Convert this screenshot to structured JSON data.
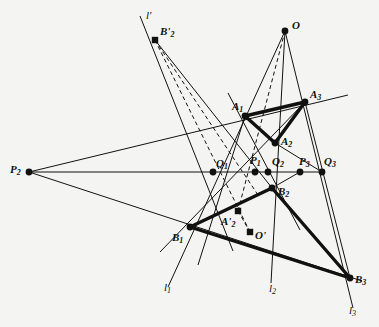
{
  "figure": {
    "background_color": "#f4f4f2",
    "ink_color": "#111111",
    "width": 379,
    "height": 327
  },
  "points": [
    {
      "id": "O",
      "label": "O",
      "sub": "",
      "prime": "",
      "x": 285,
      "y": 31,
      "lx": 292,
      "ly": 20,
      "marker": "dot"
    },
    {
      "id": "B2prime",
      "label": "B",
      "sub": "2",
      "prime": "'",
      "x": 155,
      "y": 40,
      "lx": 160,
      "ly": 26,
      "marker": "square"
    },
    {
      "id": "A3",
      "label": "A",
      "sub": "3",
      "prime": "",
      "x": 305,
      "y": 102,
      "lx": 310,
      "ly": 89,
      "marker": "dot"
    },
    {
      "id": "A1",
      "label": "A",
      "sub": "1",
      "prime": "",
      "x": 245,
      "y": 116,
      "lx": 232,
      "ly": 101,
      "marker": "dot"
    },
    {
      "id": "A2",
      "label": "A",
      "sub": "2",
      "prime": "",
      "x": 275,
      "y": 143,
      "lx": 281,
      "ly": 136,
      "marker": "dot"
    },
    {
      "id": "Q1",
      "label": "Q",
      "sub": "1",
      "prime": "",
      "x": 213,
      "y": 172,
      "lx": 216,
      "ly": 158,
      "marker": "dot"
    },
    {
      "id": "P1",
      "label": "P",
      "sub": "1",
      "prime": "",
      "x": 255,
      "y": 172,
      "lx": 250,
      "ly": 155,
      "marker": "dot"
    },
    {
      "id": "Q2",
      "label": "Q",
      "sub": "2",
      "prime": "",
      "x": 268,
      "y": 172,
      "lx": 272,
      "ly": 156,
      "marker": "dot"
    },
    {
      "id": "P3",
      "label": "P",
      "sub": "3",
      "prime": "",
      "x": 300,
      "y": 172,
      "lx": 299,
      "ly": 156,
      "marker": "dot"
    },
    {
      "id": "Q3",
      "label": "Q",
      "sub": "3",
      "prime": "",
      "x": 322,
      "y": 172,
      "lx": 324,
      "ly": 156,
      "marker": "dot"
    },
    {
      "id": "P2",
      "label": "P",
      "sub": "2",
      "prime": "",
      "x": 29,
      "y": 172,
      "lx": 10,
      "ly": 164,
      "marker": "dot"
    },
    {
      "id": "B2",
      "label": "B",
      "sub": "2",
      "prime": "",
      "x": 272,
      "y": 188,
      "lx": 278,
      "ly": 186,
      "marker": "dot"
    },
    {
      "id": "A2prime",
      "label": "A",
      "sub": "2",
      "prime": "'",
      "x": 238,
      "y": 211,
      "lx": 221,
      "ly": 216,
      "marker": "square"
    },
    {
      "id": "B1",
      "label": "B",
      "sub": "1",
      "prime": "",
      "x": 190,
      "y": 227,
      "lx": 172,
      "ly": 232,
      "marker": "dot"
    },
    {
      "id": "Oprime",
      "label": "O",
      "sub": "",
      "prime": "'",
      "x": 250,
      "y": 232,
      "lx": 255,
      "ly": 230,
      "marker": "square"
    },
    {
      "id": "B3",
      "label": "B",
      "sub": "3",
      "prime": "",
      "x": 350,
      "y": 278,
      "lx": 355,
      "ly": 274,
      "marker": "dot"
    }
  ],
  "line_labels": [
    {
      "id": "l-prime",
      "label": "l",
      "sub": "",
      "prime": "'",
      "lx": 146,
      "ly": 10
    },
    {
      "id": "l1",
      "label": "l",
      "sub": "1",
      "prime": "",
      "lx": 164,
      "ly": 282
    },
    {
      "id": "l2",
      "label": "l",
      "sub": "2",
      "prime": "",
      "lx": 269,
      "ly": 283
    },
    {
      "id": "l3",
      "label": "l",
      "sub": "3",
      "prime": "",
      "lx": 349,
      "ly": 305
    }
  ],
  "segments_thin": [
    {
      "name": "line-O-A1-B1-l1",
      "x1": 285,
      "y1": 31,
      "x2": 168,
      "y2": 287
    },
    {
      "name": "line-O-A2-B2-l2",
      "x1": 285,
      "y1": 31,
      "x2": 271,
      "y2": 283
    },
    {
      "name": "line-O-A3-B3-l3",
      "x1": 285,
      "y1": 31,
      "x2": 353,
      "y2": 308
    },
    {
      "name": "line-lprime-B2prime",
      "x1": 140,
      "y1": 16,
      "x2": 233,
      "y2": 251
    },
    {
      "name": "line-P2-A1-A3-ext",
      "x1": 29,
      "y1": 172,
      "x2": 348,
      "y2": 95
    },
    {
      "name": "line-P2-B1-B3-ext",
      "x1": 29,
      "y1": 172,
      "x2": 362,
      "y2": 281
    },
    {
      "name": "line-horizontal-P2Q3",
      "x1": 29,
      "y1": 172,
      "x2": 322,
      "y2": 172
    },
    {
      "name": "line-A2-Q1-ext",
      "x1": 305,
      "y1": 102,
      "x2": 160,
      "y2": 252
    },
    {
      "name": "line-A2-P3-Q3",
      "x1": 275,
      "y1": 143,
      "x2": 322,
      "y2": 172
    },
    {
      "name": "line-B2-P3",
      "x1": 272,
      "y1": 188,
      "x2": 300,
      "y2": 172
    },
    {
      "name": "line-A3-Q3-B3",
      "x1": 305,
      "y1": 102,
      "x2": 350,
      "y2": 278
    },
    {
      "name": "line-A1-Q1-down",
      "x1": 245,
      "y1": 116,
      "x2": 198,
      "y2": 265
    },
    {
      "name": "line-A1-B2-ext",
      "x1": 228,
      "y1": 93,
      "x2": 300,
      "y2": 230
    },
    {
      "name": "line-B2prime-down",
      "x1": 155,
      "y1": 40,
      "x2": 272,
      "y2": 188
    }
  ],
  "segments_thick": [
    {
      "name": "triangle-A-side-A1A3",
      "x1": 245,
      "y1": 116,
      "x2": 305,
      "y2": 102
    },
    {
      "name": "triangle-A-side-A1A2",
      "x1": 245,
      "y1": 116,
      "x2": 275,
      "y2": 143
    },
    {
      "name": "triangle-A-side-A2A3",
      "x1": 275,
      "y1": 143,
      "x2": 305,
      "y2": 102
    },
    {
      "name": "triangle-B-side-B1B2",
      "x1": 190,
      "y1": 227,
      "x2": 272,
      "y2": 188
    },
    {
      "name": "triangle-B-side-B2B3",
      "x1": 272,
      "y1": 188,
      "x2": 350,
      "y2": 278
    },
    {
      "name": "triangle-B-side-B1B3",
      "x1": 190,
      "y1": 227,
      "x2": 350,
      "y2": 278
    }
  ],
  "segments_dashed": [
    {
      "name": "dashed-B2prime-to-Oprime",
      "x1": 155,
      "y1": 40,
      "x2": 250,
      "y2": 232
    },
    {
      "name": "dashed-B2prime-to-P1",
      "x1": 155,
      "y1": 40,
      "x2": 258,
      "y2": 195
    },
    {
      "name": "dashed-O-to-A2prime",
      "x1": 285,
      "y1": 31,
      "x2": 238,
      "y2": 211
    },
    {
      "name": "dashed-A2prime-to-Oprime",
      "x1": 238,
      "y1": 211,
      "x2": 250,
      "y2": 232
    }
  ]
}
